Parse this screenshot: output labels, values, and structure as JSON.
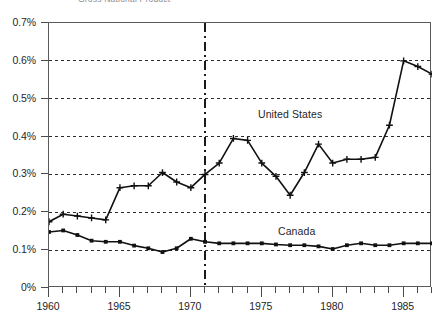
{
  "chart_data": {
    "type": "line",
    "title": "Gross National Product",
    "xlabel": "",
    "ylabel": "",
    "xlim": [
      1960,
      1987
    ],
    "ylim": [
      0,
      0.7
    ],
    "grid": true,
    "grid_axis": "y",
    "legend_position": "inline-annotation",
    "y_tick_labels": [
      "0%",
      "0.1%",
      "0.2%",
      "0.3%",
      "0.4%",
      "0.5%",
      "0.6%",
      "0.7%"
    ],
    "y_tick_values": [
      0,
      0.1,
      0.2,
      0.3,
      0.4,
      0.5,
      0.6,
      0.7
    ],
    "x_tick_labels": [
      "1960",
      "1965",
      "1970",
      "1975",
      "1980",
      "1985"
    ],
    "x_tick_values": [
      1960,
      1965,
      1970,
      1975,
      1980,
      1985
    ],
    "x_minor_ticks": [
      1961,
      1962,
      1963,
      1964,
      1966,
      1967,
      1968,
      1969,
      1971,
      1972,
      1973,
      1974,
      1976,
      1977,
      1978,
      1979,
      1981,
      1982,
      1983,
      1984,
      1986,
      1987
    ],
    "annotations": [
      {
        "text": "United States",
        "x": 1975.0,
        "y": 0.455
      },
      {
        "text": "Canada",
        "x": 1976.5,
        "y": 0.175
      }
    ],
    "reference_lines": [
      {
        "orientation": "vertical",
        "x": 1971,
        "style": "dash-dot"
      }
    ],
    "x": [
      1960,
      1961,
      1962,
      1963,
      1964,
      1965,
      1966,
      1967,
      1968,
      1969,
      1970,
      1971,
      1972,
      1973,
      1974,
      1975,
      1976,
      1977,
      1978,
      1979,
      1980,
      1981,
      1982,
      1983,
      1984,
      1985,
      1986,
      1987
    ],
    "series": [
      {
        "name": "United States",
        "marker": "plus",
        "color": "#111111",
        "values": [
          0.175,
          0.195,
          0.19,
          0.185,
          0.18,
          0.265,
          0.27,
          0.27,
          0.305,
          0.28,
          0.265,
          0.3,
          0.33,
          0.395,
          0.39,
          0.33,
          0.295,
          0.245,
          0.305,
          0.38,
          0.33,
          0.34,
          0.34,
          0.345,
          0.43,
          0.6,
          0.585,
          0.565
        ]
      },
      {
        "name": "Canada",
        "marker": "square",
        "color": "#111111",
        "values": [
          0.148,
          0.152,
          0.14,
          0.125,
          0.122,
          0.122,
          0.112,
          0.105,
          0.095,
          0.105,
          0.13,
          0.122,
          0.118,
          0.118,
          0.118,
          0.118,
          0.115,
          0.113,
          0.113,
          0.11,
          0.103,
          0.113,
          0.118,
          0.113,
          0.113,
          0.118,
          0.118,
          0.118
        ]
      }
    ]
  }
}
